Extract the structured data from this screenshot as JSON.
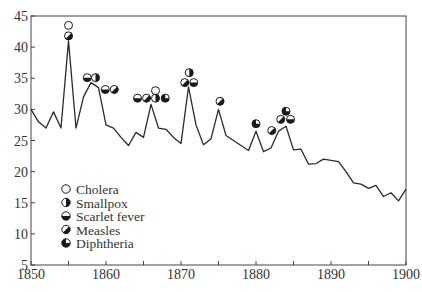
{
  "chart_data": {
    "type": "line",
    "title": "",
    "xlabel": "",
    "ylabel": "",
    "xlim": [
      1850,
      1900
    ],
    "ylim": [
      5,
      45
    ],
    "x_ticks": [
      1850,
      1860,
      1870,
      1880,
      1890,
      1900
    ],
    "x_minor_ticks": [
      1855,
      1865,
      1875,
      1885,
      1895
    ],
    "y_ticks": [
      5,
      10,
      15,
      20,
      25,
      30,
      35,
      40,
      45
    ],
    "grid": false,
    "legend_position": "lower-left inside",
    "series": [
      {
        "name": "rate",
        "x": [
          1850,
          1851,
          1852,
          1853,
          1854,
          1855,
          1856,
          1857,
          1858,
          1859,
          1860,
          1861,
          1862,
          1863,
          1864,
          1865,
          1866,
          1867,
          1868,
          1869,
          1870,
          1871,
          1872,
          1873,
          1874,
          1875,
          1876,
          1877,
          1878,
          1879,
          1880,
          1881,
          1882,
          1883,
          1884,
          1885,
          1886,
          1887,
          1888,
          1889,
          1890,
          1891,
          1892,
          1893,
          1894,
          1895,
          1896,
          1897,
          1898,
          1899,
          1900
        ],
        "values": [
          30,
          28,
          27,
          29.6,
          27,
          41,
          27,
          32,
          34.3,
          33.5,
          27.5,
          27,
          25.5,
          24.2,
          26.3,
          25.5,
          30.8,
          27,
          26.8,
          25.5,
          24.5,
          33.6,
          27.5,
          24.3,
          25.3,
          30,
          25.8,
          25,
          24.2,
          23.4,
          26.5,
          23.2,
          23.8,
          26.5,
          27.3,
          23.5,
          23.6,
          21.2,
          21.3,
          22,
          21.8,
          21.6,
          20,
          18.2,
          18,
          17.3,
          17.8,
          16,
          16.6,
          15.3,
          17.2
        ]
      }
    ],
    "legend": [
      {
        "key": "cholera",
        "label": "Cholera",
        "fill": "none"
      },
      {
        "key": "smallpox",
        "label": "Smallpox",
        "fill": "right-half"
      },
      {
        "key": "scarlet",
        "label": "Scarlet fever",
        "fill": "bottom-half"
      },
      {
        "key": "measles",
        "label": "Measles",
        "fill": "diagonal-lower-right"
      },
      {
        "key": "diphtheria",
        "label": "Diphtheria",
        "fill": "three-quarters"
      }
    ],
    "annotations": [
      {
        "year": 1855,
        "diseases": [
          "measles",
          "cholera"
        ]
      },
      {
        "year": 1857.5,
        "diseases": [
          "scarlet"
        ]
      },
      {
        "year": 1858.5,
        "diseases": [
          "smallpox"
        ]
      },
      {
        "year": 1859.8,
        "diseases": [
          "scarlet"
        ]
      },
      {
        "year": 1861,
        "diseases": [
          "measles"
        ]
      },
      {
        "year": 1864.3,
        "diseases": [
          "scarlet"
        ]
      },
      {
        "year": 1865.5,
        "diseases": [
          "measles"
        ]
      },
      {
        "year": 1866.6,
        "diseases": [
          "smallpox",
          "cholera"
        ]
      },
      {
        "year": 1867.8,
        "diseases": [
          "diphtheria"
        ]
      },
      {
        "year": 1870.6,
        "diseases": [
          "measles"
        ]
      },
      {
        "year": 1871.6,
        "diseases": [
          "scarlet"
        ]
      },
      {
        "year": 1871.1,
        "diseases": [
          "smallpox"
        ],
        "row": 2
      },
      {
        "year": 1875.2,
        "diseases": [
          "measles"
        ]
      },
      {
        "year": 1880,
        "diseases": [
          "diphtheria"
        ]
      },
      {
        "year": 1882.2,
        "diseases": [
          "measles"
        ]
      },
      {
        "year": 1883.4,
        "diseases": [
          "measles"
        ]
      },
      {
        "year": 1884.5,
        "diseases": [
          "scarlet"
        ]
      },
      {
        "year": 1884,
        "diseases": [
          "diphtheria"
        ],
        "row": 2
      }
    ]
  }
}
